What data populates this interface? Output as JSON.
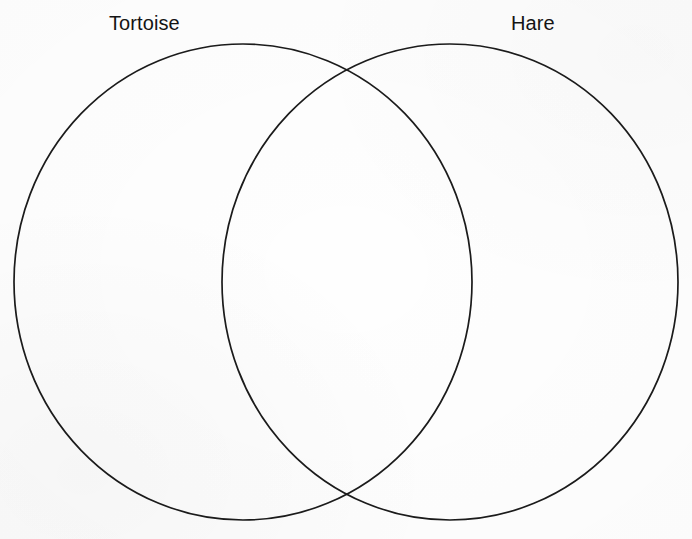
{
  "diagram": {
    "type": "venn",
    "title": "",
    "background_color": "#fefefe",
    "stroke_color": "#1b1b1b",
    "stroke_width": 1.7,
    "label_color": "#141414",
    "sets": [
      {
        "id": "tortoise",
        "label": "Tortoise",
        "label_position": "top-left",
        "center_x": 243,
        "center_y": 282,
        "radius_x": 229,
        "radius_y": 238,
        "items": []
      },
      {
        "id": "hare",
        "label": "Hare",
        "label_position": "top-right",
        "center_x": 450,
        "center_y": 282,
        "radius_x": 228,
        "radius_y": 238,
        "items": []
      }
    ],
    "intersection": {
      "label": "",
      "items": [],
      "top_point_x": 347,
      "top_point_y": 73,
      "bottom_point_x": 347,
      "bottom_point_y": 497
    }
  },
  "canvas": {
    "width": 692,
    "height": 539
  }
}
